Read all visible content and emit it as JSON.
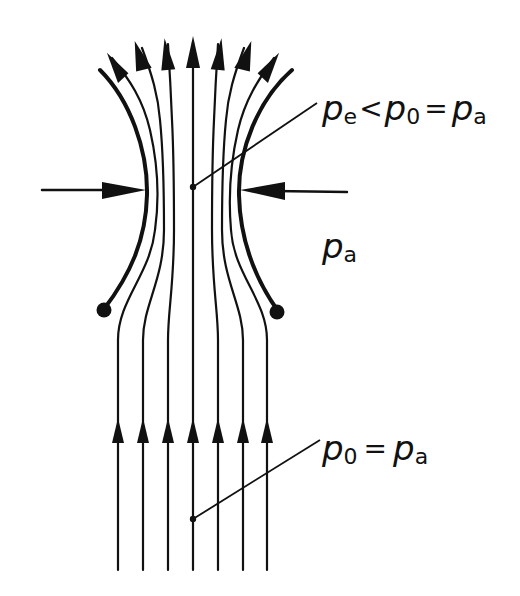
{
  "figure": {
    "type": "streamline-diagram",
    "colors": {
      "ink": "#111111",
      "background": "#ffffff"
    },
    "labels": {
      "top_right": {
        "symbol_1": "p",
        "sub_1": "e",
        "op_1": "<",
        "symbol_2": "p",
        "sub_2": "0",
        "op_2": "=",
        "symbol_3": "p",
        "sub_3": "a",
        "text": "pe < p0 = pa"
      },
      "right_middle": {
        "symbol": "p",
        "sub": "a",
        "text": "pa"
      },
      "bottom_right": {
        "symbol_1": "p",
        "sub_1": "0",
        "op": "=",
        "symbol_2": "p",
        "sub_2": "a",
        "text": "p0 = pa"
      }
    },
    "streamlines": {
      "count": 7,
      "inflow_x": [
        118,
        143,
        168,
        193,
        218,
        243,
        267
      ],
      "inflow_arrow_count": 7,
      "outflow_arrow_count": 7,
      "direction": "upward"
    },
    "walls": {
      "count": 2,
      "end_marker": "filled-dot"
    },
    "pressure_arrows": {
      "count": 2,
      "directions": [
        "right",
        "left"
      ]
    },
    "leader_points": [
      {
        "id": "waist-point",
        "x": 193,
        "y": 187
      },
      {
        "id": "inflow-point",
        "x": 193,
        "y": 519
      }
    ]
  }
}
